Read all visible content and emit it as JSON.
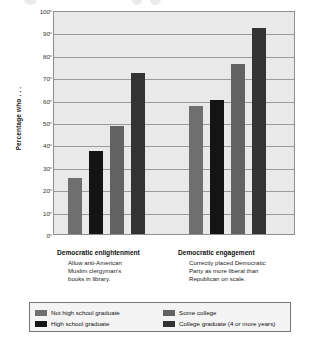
{
  "chart_data": {
    "type": "bar",
    "title": "",
    "subtitle": "",
    "xlabel": "",
    "ylabel": "Percentage who . . .",
    "ylim": [
      0,
      100
    ],
    "ytick_labels": [
      "100",
      "90",
      "80",
      "70",
      "60",
      "50",
      "40",
      "30",
      "20",
      "10",
      "0"
    ],
    "ytick_values": [
      100,
      90,
      80,
      70,
      60,
      50,
      40,
      30,
      20,
      10,
      0
    ],
    "grid": true,
    "legend_position": "bottom",
    "categories": [
      "Democratic enlightenment",
      "Democratic engagement"
    ],
    "category_descriptions": [
      "Allow anti-American Muslim clergyman's books in library.",
      "Correctly placed Democratic Party as more liberal than Republican on scale."
    ],
    "series": [
      {
        "name": "Not high school graduate",
        "color": "#6f6f6f",
        "values": [
          25,
          57
        ]
      },
      {
        "name": "High school graduate",
        "color": "#141414",
        "values": [
          37,
          60
        ]
      },
      {
        "name": "Some college",
        "color": "#626262",
        "values": [
          48,
          76
        ]
      },
      {
        "name": "College graduate (4 or more years)",
        "color": "#333333",
        "values": [
          72,
          92
        ]
      }
    ]
  },
  "axis": {
    "y_title": "Percentage who . . ."
  },
  "categories": [
    {
      "label": "Democratic enlightenment",
      "sub_lines": [
        "Allow anti-American",
        "Muslim clergyman's",
        "books in library."
      ]
    },
    {
      "label": "Democratic engagement",
      "sub_lines": [
        "Correctly placed Democratic",
        "Party as more liberal than",
        "Republican on scale."
      ]
    }
  ],
  "legend": {
    "entries": [
      {
        "label": "Not high school graduate",
        "color": "#6f6f6f"
      },
      {
        "label": "Some college",
        "color": "#626262"
      },
      {
        "label": "High school graduate",
        "color": "#141414"
      },
      {
        "label": "College graduate (4 or more years)",
        "color": "#333333"
      }
    ]
  },
  "colors": {
    "plot_background": "#e9e9e9",
    "gridline": "#9a9a9a",
    "axis_border": "#8f8f8f",
    "page_background": "#ffffff"
  }
}
